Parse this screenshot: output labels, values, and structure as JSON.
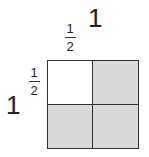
{
  "labels": {
    "top_whole": "1",
    "left_whole": "1",
    "top_fraction": {
      "numerator": "1",
      "denominator": "2"
    },
    "left_fraction": {
      "numerator": "1",
      "denominator": "2"
    }
  },
  "grid": {
    "rows": 2,
    "cols": 2,
    "cells": [
      {
        "position": "top-left",
        "shaded": false,
        "color": "#ffffff"
      },
      {
        "position": "top-right",
        "shaded": true,
        "color": "#d9d9d9"
      },
      {
        "position": "bottom-left",
        "shaded": true,
        "color": "#d9d9d9"
      },
      {
        "position": "bottom-right",
        "shaded": true,
        "color": "#d9d9d9"
      }
    ],
    "border_color": "#333333"
  }
}
